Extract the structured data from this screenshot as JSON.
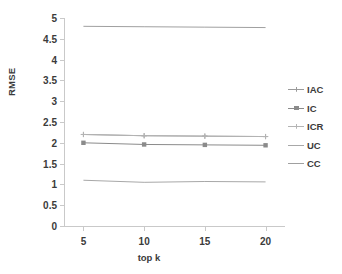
{
  "chart_data": {
    "type": "line",
    "title": "",
    "xlabel": "top k",
    "ylabel": "RMSE",
    "x": [
      5,
      10,
      15,
      20
    ],
    "xticklabels": [
      "5",
      "10",
      "15",
      "20"
    ],
    "yticks": [
      0,
      0.5,
      1,
      1.5,
      2,
      2.5,
      3,
      3.5,
      4,
      4.5,
      5
    ],
    "yticklabels": [
      "0",
      "0.5",
      "1",
      "1.5",
      "2",
      "2.5",
      "3",
      "3.5",
      "4",
      "4.5",
      "5"
    ],
    "ylim": [
      0,
      5
    ],
    "xlim": [
      3.4,
      21.6
    ],
    "grid": false,
    "legend_position": "right",
    "series": [
      {
        "name": "IAC",
        "values": [
          2.2,
          2.17,
          2.16,
          2.15
        ],
        "color": "#9a9a9a",
        "marker": "plus"
      },
      {
        "name": "IC",
        "values": [
          2.0,
          1.96,
          1.95,
          1.94
        ],
        "color": "#8b8b8b",
        "marker": "square"
      },
      {
        "name": "ICR",
        "values": [
          2.2,
          2.17,
          2.16,
          2.15
        ],
        "color": "#b4b4b4",
        "marker": "plus"
      },
      {
        "name": "UC",
        "values": [
          1.1,
          1.05,
          1.07,
          1.06
        ],
        "color": "#a8a8a8",
        "marker": "none"
      },
      {
        "name": "CC",
        "values": [
          4.8,
          4.79,
          4.78,
          4.77
        ],
        "color": "#a0a0a0",
        "marker": "none"
      }
    ]
  },
  "axis": {
    "line_color": "#c9c9c9"
  }
}
